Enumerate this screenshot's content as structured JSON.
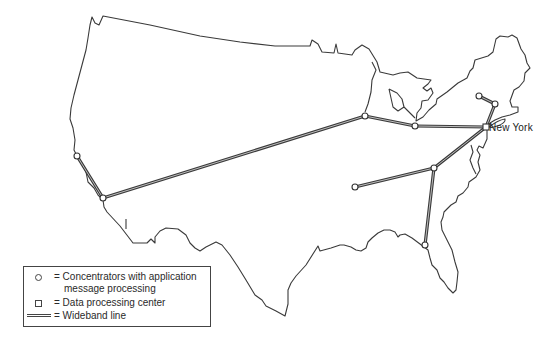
{
  "map": {
    "region": "Continental United States",
    "colors": {
      "outline": "#3a3a3a",
      "line": "#3a3a3a",
      "background": "#ffffff"
    },
    "labels": [
      {
        "text": "New York",
        "x": 489,
        "y": 123
      }
    ],
    "nodes": [
      {
        "id": "new-york",
        "type": "data-processing-center",
        "x": 486,
        "y": 127
      },
      {
        "id": "san-francisco",
        "type": "concentrator",
        "x": 77,
        "y": 156
      },
      {
        "id": "los-angeles",
        "type": "concentrator",
        "x": 103,
        "y": 198
      },
      {
        "id": "chicago",
        "type": "concentrator",
        "x": 365,
        "y": 116
      },
      {
        "id": "cleveland",
        "type": "concentrator",
        "x": 415,
        "y": 126
      },
      {
        "id": "albany",
        "type": "concentrator",
        "x": 495,
        "y": 104
      },
      {
        "id": "boston-north",
        "type": "concentrator",
        "x": 479,
        "y": 96
      },
      {
        "id": "washington",
        "type": "concentrator",
        "x": 434,
        "y": 168
      },
      {
        "id": "st-louis",
        "type": "concentrator",
        "x": 355,
        "y": 187
      },
      {
        "id": "atlanta",
        "type": "concentrator",
        "x": 425,
        "y": 245
      }
    ],
    "links": [
      [
        "san-francisco",
        "los-angeles"
      ],
      [
        "los-angeles",
        "chicago"
      ],
      [
        "chicago",
        "cleveland"
      ],
      [
        "cleveland",
        "new-york"
      ],
      [
        "new-york",
        "albany"
      ],
      [
        "albany",
        "boston-north"
      ],
      [
        "new-york",
        "washington"
      ],
      [
        "washington",
        "st-louis"
      ],
      [
        "washington",
        "atlanta"
      ]
    ]
  },
  "legend": {
    "items": [
      {
        "symbol": "circle",
        "label_line1": "= Concentrators with application",
        "label_line2": "message processing"
      },
      {
        "symbol": "square",
        "label_line1": "= Data processing center"
      },
      {
        "symbol": "wideband-line",
        "label_line1": "= Wideband line"
      }
    ]
  }
}
